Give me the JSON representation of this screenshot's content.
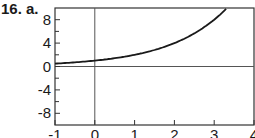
{
  "problem_label": "16.  a.",
  "chart_data": {
    "type": "line",
    "title": "",
    "xlabel": "",
    "ylabel": "",
    "xlim": [
      -1,
      4
    ],
    "ylim": [
      -10,
      10
    ],
    "grid": false,
    "x_ticks": [
      -1,
      0,
      1,
      2,
      3,
      4
    ],
    "x_tick_labels": [
      "-1",
      "0",
      "1",
      "2",
      "3",
      "4"
    ],
    "y_ticks": [
      -8,
      -4,
      0,
      4,
      8
    ],
    "y_tick_labels": [
      "-8",
      "-4",
      "0",
      "4",
      "8"
    ],
    "y_minor_ticks": [
      -6,
      -2,
      2,
      6
    ],
    "series": [
      {
        "name": "y = 2^x",
        "x": [
          -1,
          -0.5,
          0,
          0.5,
          1,
          1.5,
          2,
          2.5,
          3,
          3.32
        ],
        "values": [
          0.5,
          0.71,
          1,
          1.41,
          2,
          2.83,
          4,
          5.66,
          8,
          10
        ]
      }
    ],
    "annotations": [
      "axis line at x=0",
      "axis line at y=0"
    ]
  },
  "colors": {
    "line": "#1a1a1a",
    "axis": "#555555",
    "background": "#ffffff"
  }
}
